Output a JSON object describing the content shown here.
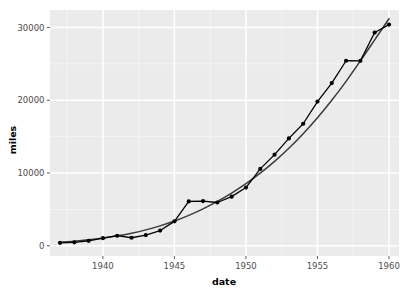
{
  "chart_data": {
    "type": "line",
    "title": "",
    "subtitle": "",
    "xlabel": "date",
    "ylabel": "miles",
    "xlim": [
      1936.3,
      1960.7
    ],
    "ylim": [
      -1400,
      32400
    ],
    "xticks": [
      1940,
      1945,
      1950,
      1955,
      1960
    ],
    "xtick_labels": [
      "1940",
      "1945",
      "1950",
      "1955",
      "1960"
    ],
    "yticks": [
      0,
      10000,
      20000,
      30000
    ],
    "ytick_labels": [
      "0",
      "10000",
      "20000",
      "30000"
    ],
    "grid": true,
    "legend": "none",
    "panel_background": "#ebebeb",
    "grid_color_major": "#ffffff",
    "grid_color_minor": "#f5f5f5",
    "series": [
      {
        "name": "observed",
        "kind": "line+points",
        "color": "#000000",
        "point_color": "#000000",
        "x": [
          1937,
          1938,
          1939,
          1940,
          1941,
          1942,
          1943,
          1944,
          1945,
          1946,
          1947,
          1948,
          1949,
          1950,
          1951,
          1952,
          1953,
          1954,
          1955,
          1956,
          1957,
          1958,
          1959,
          1960
        ],
        "values": [
          412,
          480,
          683,
          1052,
          1385,
          1109,
          1471,
          2100,
          3362,
          6100,
          6150,
          5948,
          6755,
          8003,
          10566,
          12528,
          14760,
          16769,
          19820,
          22362,
          25430,
          25420,
          29309,
          30400
        ]
      },
      {
        "name": "smooth",
        "kind": "line",
        "color": "#3a3a3a",
        "x": [
          1937,
          1938,
          1939,
          1940,
          1941,
          1942,
          1943,
          1944,
          1945,
          1946,
          1947,
          1948,
          1949,
          1950,
          1951,
          1952,
          1953,
          1954,
          1955,
          1956,
          1957,
          1958,
          1959,
          1960
        ],
        "values": [
          500,
          640,
          830,
          1070,
          1370,
          1740,
          2190,
          2740,
          3400,
          4180,
          5080,
          6100,
          7250,
          8540,
          9980,
          11600,
          13400,
          15400,
          17600,
          20000,
          22600,
          25400,
          28300,
          31200
        ]
      }
    ]
  },
  "axes": {
    "y_title": "miles",
    "x_title": "date"
  }
}
